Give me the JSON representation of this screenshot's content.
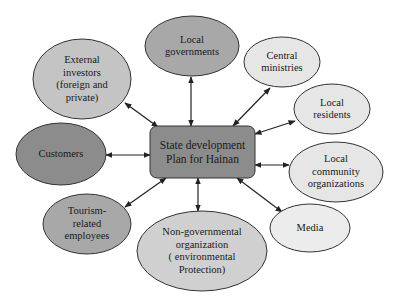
{
  "diagram": {
    "type": "stakeholder-map",
    "center": {
      "id": "center",
      "label": "State development\nPlan for Hainan",
      "x": 150,
      "y": 126,
      "w": 105,
      "h": 52,
      "fill": "#8c8c8c"
    },
    "nodes": [
      {
        "id": "local-governments",
        "label": "Local\ngovernments",
        "cx": 192,
        "cy": 46,
        "rx": 47,
        "ry": 30,
        "fill": "#a8a8a8"
      },
      {
        "id": "external-investors",
        "label": "External\ninvestors\n(foreign and\nprivate)",
        "cx": 82,
        "cy": 79,
        "rx": 49,
        "ry": 40,
        "fill": "#c4c4c4"
      },
      {
        "id": "central-ministries",
        "label": "Central\nministries",
        "cx": 282,
        "cy": 62,
        "rx": 38,
        "ry": 25,
        "fill": "#e6e6e6"
      },
      {
        "id": "local-residents",
        "label": "Local\nresidents",
        "cx": 332,
        "cy": 109,
        "rx": 38,
        "ry": 25,
        "fill": "#e6e6e6"
      },
      {
        "id": "customers",
        "label": "Customers",
        "cx": 61,
        "cy": 154,
        "rx": 45,
        "ry": 31,
        "fill": "#8c8c8c"
      },
      {
        "id": "local-community-organizations",
        "label": "Local\ncommunity\norganizations",
        "cx": 336,
        "cy": 172,
        "rx": 47,
        "ry": 30,
        "fill": "#e6e6e6"
      },
      {
        "id": "tourism-related-employees",
        "label": "Tourism-\nrelated\nemployees",
        "cx": 87,
        "cy": 224,
        "rx": 44,
        "ry": 30,
        "fill": "#a8a8a8"
      },
      {
        "id": "non-governmental-organization",
        "label": "Non-governmental\norganization\n( environmental\nProtection)",
        "cx": 202,
        "cy": 251,
        "rx": 65,
        "ry": 40,
        "fill": "#d0d0d0"
      },
      {
        "id": "media",
        "label": "Media",
        "cx": 310,
        "cy": 228,
        "rx": 40,
        "ry": 24,
        "fill": "#ececec"
      }
    ],
    "edges": [
      {
        "to": "local-governments",
        "x1": 191,
        "y1": 126,
        "x2": 191,
        "y2": 77
      },
      {
        "to": "external-investors",
        "x1": 158,
        "y1": 127,
        "x2": 125,
        "y2": 103
      },
      {
        "to": "central-ministries",
        "x1": 233,
        "y1": 126,
        "x2": 270,
        "y2": 88
      },
      {
        "to": "local-residents",
        "x1": 255,
        "y1": 134,
        "x2": 295,
        "y2": 121
      },
      {
        "to": "customers",
        "x1": 150,
        "y1": 155,
        "x2": 106,
        "y2": 155
      },
      {
        "to": "local-community-organizations",
        "x1": 255,
        "y1": 165,
        "x2": 289,
        "y2": 165
      },
      {
        "to": "tourism-related-employees",
        "x1": 166,
        "y1": 178,
        "x2": 125,
        "y2": 207
      },
      {
        "to": "non-governmental-organization",
        "x1": 198,
        "y1": 178,
        "x2": 198,
        "y2": 211
      },
      {
        "to": "media",
        "x1": 237,
        "y1": 178,
        "x2": 282,
        "y2": 212
      }
    ],
    "colors": {
      "stroke": "#333333",
      "text": "#1a1a1a",
      "background": "#ffffff"
    }
  }
}
